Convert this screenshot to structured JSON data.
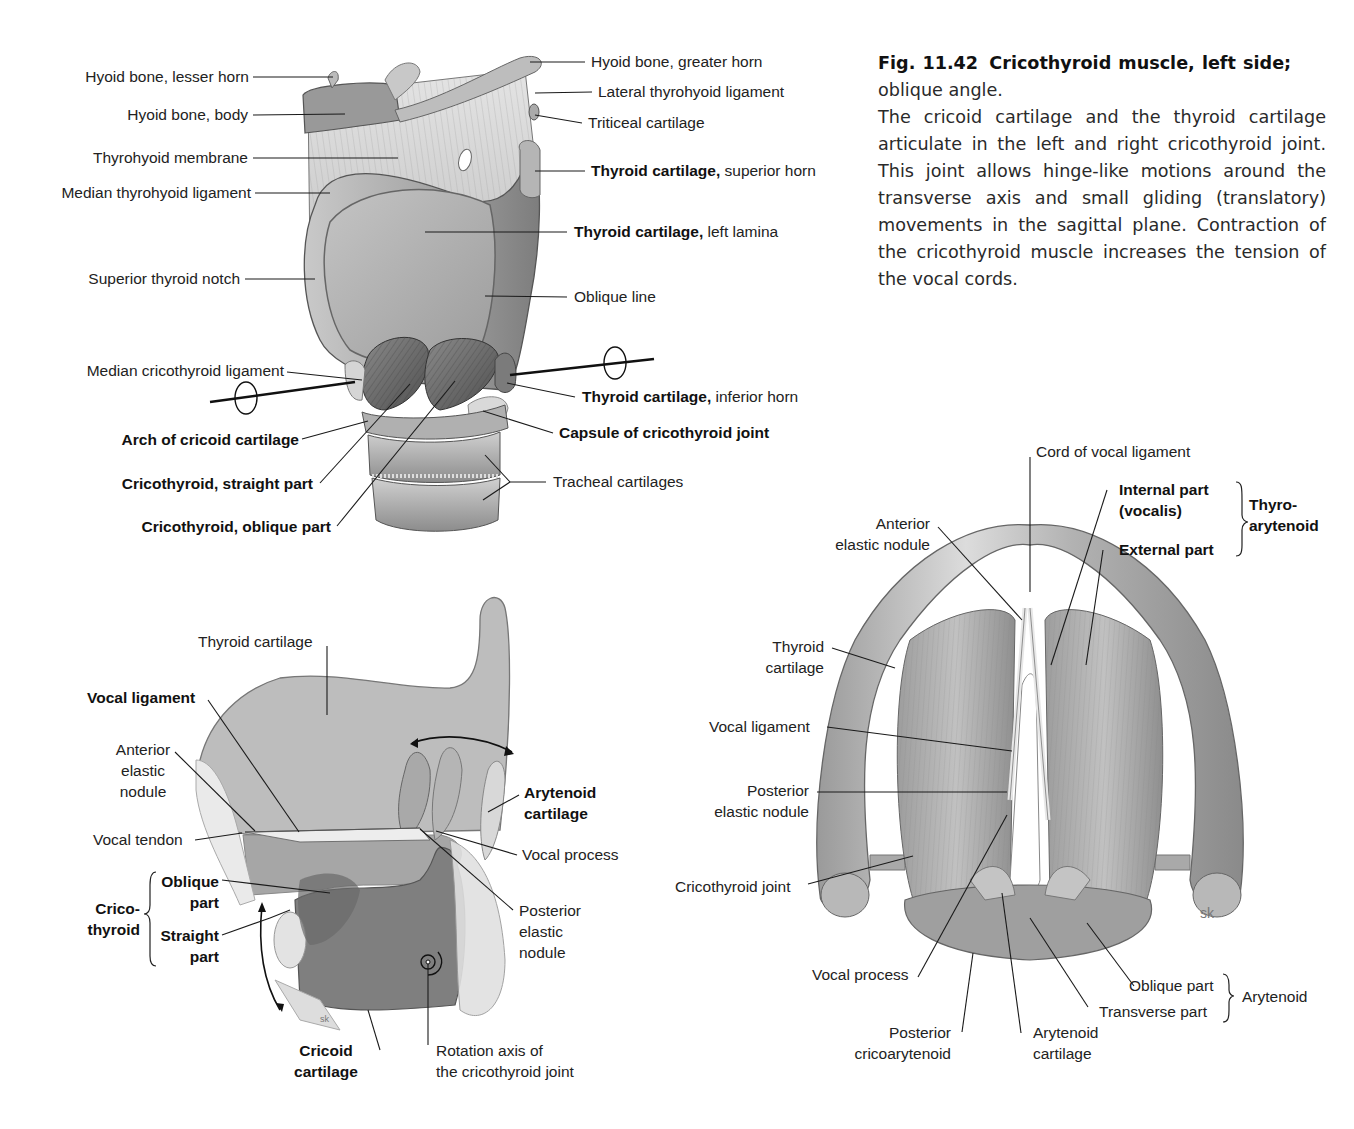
{
  "caption": {
    "figure_number": "Fig. 11.42",
    "title": "Cricothyroid muscle, left side;",
    "subtitle": "oblique angle.",
    "body": "The cricoid cartilage and the thyroid cartilage articulate in the left and right cricothyroid joint. This joint allows hinge-like motions around the transverse axis and small gliding (translatory) movements in the sagittal plane. Contraction of the cricothyroid muscle increases the tension of the vocal cords."
  },
  "figure_a": {
    "name": "Larynx, left oblique view",
    "labels_left": [
      {
        "text": "Hyoid bone, lesser horn"
      },
      {
        "text": "Hyoid bone, body"
      },
      {
        "text": "Thyrohyoid membrane"
      },
      {
        "text": "Median thyrohyoid ligament"
      },
      {
        "text": "Superior thyroid notch"
      },
      {
        "text": "Median cricothyroid ligament"
      },
      {
        "text": "Arch of cricoid cartilage"
      },
      {
        "text": "Cricothyroid, straight part"
      },
      {
        "text": "Cricothyroid, oblique part"
      }
    ],
    "labels_right": [
      {
        "text": "Hyoid bone, greater horn"
      },
      {
        "text": "Lateral thyrohyoid ligament"
      },
      {
        "text": "Triticeal cartilage"
      },
      {
        "bold": "Thyroid cartilage,",
        "text": " superior horn"
      },
      {
        "bold": "Thyroid cartilage,",
        "text": " left lamina"
      },
      {
        "text": "Oblique line"
      },
      {
        "bold": "Thyroid cartilage,",
        "text": " inferior horn"
      },
      {
        "text": "Capsule of cricothyroid joint"
      },
      {
        "text": "Tracheal cartilages"
      }
    ]
  },
  "figure_b": {
    "name": "Larynx, lateral schematic",
    "labels": {
      "thyroid_cartilage": "Thyroid cartilage",
      "vocal_ligament": "Vocal ligament",
      "anterior_elastic_nodule": [
        "Anterior",
        "elastic",
        "nodule"
      ],
      "vocal_tendon": "Vocal tendon",
      "crico_thyroid": [
        "Crico-",
        "thyroid"
      ],
      "oblique_part": [
        "Oblique",
        "part"
      ],
      "straight_part": [
        "Straight",
        "part"
      ],
      "cricoid_cartilage": [
        "Cricoid",
        "cartilage"
      ],
      "rotation_axis": [
        "Rotation axis of",
        "the cricothyroid joint"
      ],
      "arytenoid_cartilage": [
        "Arytenoid",
        "cartilage"
      ],
      "vocal_process": "Vocal process",
      "posterior_elastic_nodule": [
        "Posterior",
        "elastic",
        "nodule"
      ],
      "artist_signature": "sk"
    }
  },
  "figure_c": {
    "name": "Larynx, superior view",
    "labels": {
      "cord_of_vocal_ligament": "Cord of vocal ligament",
      "anterior_elastic_nodule": [
        "Anterior",
        "elastic nodule"
      ],
      "internal_part": [
        "Internal part",
        "(vocalis)"
      ],
      "external_part": "External part",
      "thyro_arytenoid": [
        "Thyro-",
        "arytenoid"
      ],
      "thyroid_cartilage": [
        "Thyroid",
        "cartilage"
      ],
      "vocal_ligament": "Vocal ligament",
      "posterior_elastic_nodule": [
        "Posterior",
        "elastic nodule"
      ],
      "cricothyroid_joint": "Cricothyroid joint",
      "vocal_process": "Vocal process",
      "posterior_cricoarytenoid": [
        "Posterior",
        "cricoarytenoid"
      ],
      "arytenoid_cartilage": [
        "Arytenoid",
        "cartilage"
      ],
      "oblique_part": "Oblique part",
      "transverse_part": "Transverse part",
      "arytenoid": "Arytenoid",
      "artist_signature": "sk"
    }
  }
}
